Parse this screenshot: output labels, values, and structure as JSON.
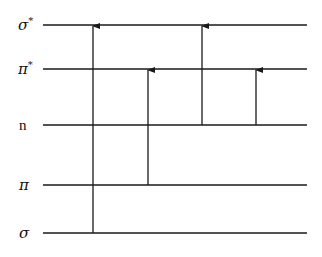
{
  "diagram": {
    "title": "",
    "levels": [
      {
        "id": "sigma_star",
        "label": "σ*",
        "base": "σ",
        "sup": "*",
        "y": 25
      },
      {
        "id": "pi_star",
        "label": "π*",
        "base": "π",
        "sup": "*",
        "y": 69
      },
      {
        "id": "n",
        "label": "n",
        "base": "n",
        "sup": "",
        "y": 125
      },
      {
        "id": "pi",
        "label": "π",
        "base": "π",
        "sup": "",
        "y": 185
      },
      {
        "id": "sigma",
        "label": "σ",
        "base": "σ",
        "sup": "",
        "y": 233
      }
    ],
    "transitions": [
      {
        "from": "sigma",
        "to": "sigma_star",
        "label": "σ→σ*",
        "x": 93
      },
      {
        "from": "pi",
        "to": "pi_star",
        "label": "π→π*",
        "x": 148
      },
      {
        "from": "n",
        "to": "sigma_star",
        "label": "n→σ*",
        "x": 202
      },
      {
        "from": "n",
        "to": "pi_star",
        "label": "n→π*",
        "x": 256
      }
    ],
    "line_color": "#1a1a1a"
  }
}
